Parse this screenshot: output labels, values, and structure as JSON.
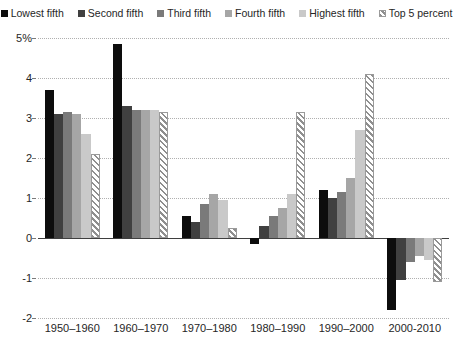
{
  "chart_data": {
    "type": "bar",
    "title": "",
    "subtitle": "",
    "xlabel": "",
    "ylabel": "",
    "ylim": [
      -2,
      5
    ],
    "yticks": [
      5,
      4,
      3,
      2,
      1,
      0,
      -1,
      -2
    ],
    "ytick_labels": [
      "5%",
      "4",
      "3",
      "2",
      "1",
      "0",
      "-1",
      "-2"
    ],
    "grid": true,
    "legend_position": "top",
    "categories": [
      "1950–1960",
      "1960–1970",
      "1970–1980",
      "1980–1990",
      "1990–2000",
      "2000-2010"
    ],
    "series": [
      {
        "name": "Lowest fifth",
        "color": "#0d0d0d",
        "pattern": "solid",
        "values": [
          3.7,
          4.85,
          0.55,
          -0.15,
          1.2,
          -1.8
        ]
      },
      {
        "name": "Second fifth",
        "color": "#404040",
        "pattern": "solid",
        "values": [
          3.1,
          3.3,
          0.4,
          0.3,
          1.0,
          -1.05
        ]
      },
      {
        "name": "Third fifth",
        "color": "#7a7a7a",
        "pattern": "solid",
        "values": [
          3.15,
          3.2,
          0.85,
          0.55,
          1.15,
          -0.6
        ]
      },
      {
        "name": "Fourth fifth",
        "color": "#a6a6a6",
        "pattern": "solid",
        "values": [
          3.1,
          3.2,
          1.1,
          0.75,
          1.5,
          -0.45
        ]
      },
      {
        "name": "Highest fifth",
        "color": "#c9c9c9",
        "pattern": "solid",
        "values": [
          2.6,
          3.2,
          0.95,
          1.1,
          2.7,
          -0.55
        ]
      },
      {
        "name": "Top 5 percent",
        "color": "#8f8f8f",
        "pattern": "diagonal-hatch",
        "values": [
          2.1,
          3.15,
          0.25,
          3.15,
          4.1,
          -1.1
        ]
      }
    ]
  },
  "axis": {
    "y_unit_label": "5%",
    "zero_label": "0"
  }
}
